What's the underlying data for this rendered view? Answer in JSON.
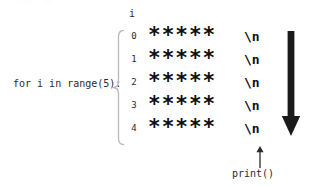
{
  "diagram": {
    "loop_label": "for i in range(5):",
    "column_header": "i",
    "ghost_remnant": "for i in",
    "rows": [
      {
        "index": "0",
        "stars": "*****",
        "newline": "\\n"
      },
      {
        "index": "1",
        "stars": "*****",
        "newline": "\\n"
      },
      {
        "index": "2",
        "stars": "*****",
        "newline": "\\n"
      },
      {
        "index": "3",
        "stars": "*****",
        "newline": "\\n"
      },
      {
        "index": "4",
        "stars": "*****",
        "newline": "\\n"
      }
    ],
    "print_label": "print()",
    "colors": {
      "text": "#2b2b2b",
      "glyph": "#101010",
      "brace": "#b8b8b8",
      "flow_arrow": "#1a1a1a",
      "print_arrow": "#2b2b2b",
      "background": "#ffffff"
    },
    "icons": {
      "brace": "curly-brace-left",
      "print_arrow": "arrow-up-icon",
      "flow_arrow": "arrow-down-icon"
    }
  }
}
